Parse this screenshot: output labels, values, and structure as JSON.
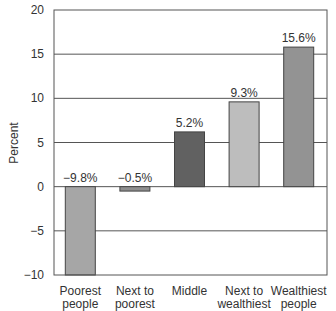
{
  "chart_data": {
    "type": "bar",
    "title": "",
    "xlabel": "",
    "ylabel": "Percent",
    "ylim": [
      -10,
      20
    ],
    "yticks": [
      -10,
      -5,
      0,
      5,
      10,
      15,
      20
    ],
    "ytick_labels": [
      "−10",
      "−5",
      "0",
      "5",
      "10",
      "15",
      "20"
    ],
    "grid": true,
    "legend": null,
    "categories": [
      "Poorest people",
      "Next to poorest",
      "Middle",
      "Next to wealthiest",
      "Wealthiest people"
    ],
    "category_lines": [
      [
        "Poorest",
        "people"
      ],
      [
        "Next to",
        "poorest"
      ],
      [
        "Middle",
        ""
      ],
      [
        "Next to",
        "wealthiest"
      ],
      [
        "Wealthiest",
        "people"
      ]
    ],
    "values": [
      -9.8,
      -0.5,
      5.2,
      9.3,
      15.6
    ],
    "drawn_heights": [
      -10,
      -0.5,
      6.2,
      9.6,
      15.8
    ],
    "data_labels": [
      "−9.8%",
      "−0.5%",
      "5.2%",
      "9.3%",
      "15.6%"
    ],
    "colors": [
      "#a6a6a6",
      "#8f8f8f",
      "#616161",
      "#bdbdbd",
      "#939393"
    ]
  }
}
